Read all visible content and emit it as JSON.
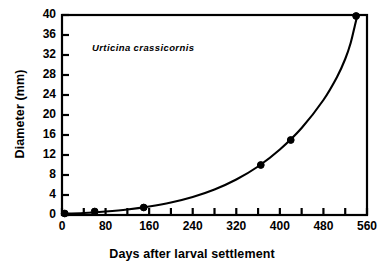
{
  "chart_data": {
    "type": "scatter",
    "title": "",
    "annotation": "Urticina  crassicornis",
    "xlabel": "Days after larval settlement",
    "ylabel": "Diameter (mm)",
    "xlim": [
      0,
      560
    ],
    "ylim": [
      0,
      40
    ],
    "xticks": [
      0,
      80,
      160,
      240,
      320,
      400,
      480,
      560
    ],
    "xtick_labels": [
      "0",
      "80",
      "160",
      "240",
      "320",
      "400",
      "480",
      "560"
    ],
    "xminor_step": 40,
    "yticks": [
      0,
      4,
      8,
      12,
      16,
      20,
      24,
      28,
      32,
      36,
      40
    ],
    "ytick_labels": [
      "0",
      "4",
      "8",
      "12",
      "16",
      "20",
      "24",
      "28",
      "32",
      "36",
      "40"
    ],
    "grid": false,
    "legend": false,
    "marker": "filled-circle",
    "marker_color": "#000000",
    "line_color": "#000000",
    "points": [
      {
        "x": 5,
        "y": 0.3
      },
      {
        "x": 60,
        "y": 0.7
      },
      {
        "x": 150,
        "y": 1.5
      },
      {
        "x": 365,
        "y": 10.0
      },
      {
        "x": 420,
        "y": 15.0
      },
      {
        "x": 540,
        "y": 39.8
      }
    ],
    "series": [
      {
        "name": "Urticina crassicornis growth",
        "x": [
          5,
          60,
          150,
          365,
          420,
          540
        ],
        "values": [
          0.3,
          0.7,
          1.5,
          10.0,
          15.0,
          39.8
        ]
      }
    ],
    "fit_curve": {
      "description": "smooth accelerating growth curve through the data points",
      "x": [
        0,
        40,
        80,
        120,
        160,
        200,
        240,
        280,
        320,
        360,
        400,
        440,
        480,
        505,
        520,
        530,
        538,
        542
      ],
      "y": [
        0.25,
        0.4,
        0.7,
        1.1,
        1.7,
        2.5,
        3.6,
        5.1,
        7.1,
        9.7,
        13.1,
        17.4,
        23.0,
        27.6,
        31.2,
        34.4,
        38.0,
        39.8
      ]
    }
  },
  "colors": {
    "ink": "#000000",
    "background": "#ffffff"
  }
}
